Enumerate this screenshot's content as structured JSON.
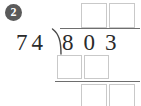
{
  "problem": {
    "number_label": "2",
    "badge_color": "#5a5a5a",
    "ink_color": "#2b2b2b",
    "box_border_color": "#c9c9c9",
    "rule_color": "#6e6e6e"
  },
  "division": {
    "divisor": "74",
    "dividend": "803",
    "operator_icon": "division-bracket-icon"
  },
  "quotient_boxes": [
    {
      "name": "quotient-tens",
      "value": ""
    },
    {
      "name": "quotient-ones",
      "value": ""
    }
  ],
  "partial_product_boxes": [
    {
      "name": "partial-product-tens",
      "value": ""
    },
    {
      "name": "partial-product-ones",
      "value": ""
    }
  ],
  "remainder_boxes": [
    {
      "name": "remainder-tens",
      "value": ""
    },
    {
      "name": "remainder-ones",
      "value": ""
    }
  ]
}
